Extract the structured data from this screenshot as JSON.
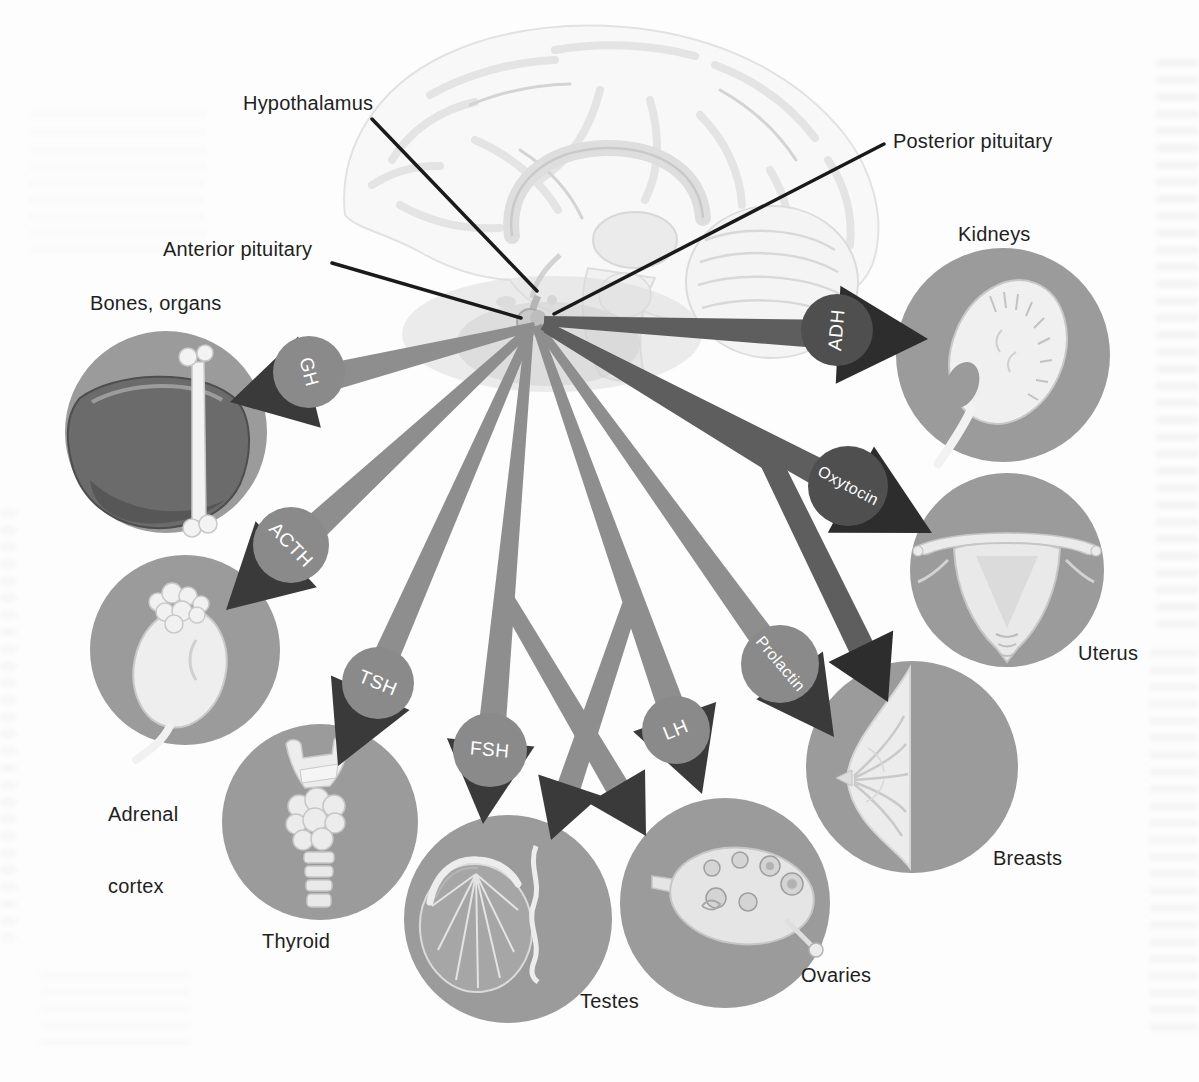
{
  "figure": {
    "brain_labels": {
      "hypothalamus": "Hypothalamus",
      "anterior_pituitary": "Anterior pituitary",
      "posterior_pituitary": "Posterior pituitary"
    },
    "hormones": {
      "gh": "GH",
      "acth": "ACTH",
      "tsh": "TSH",
      "fsh": "FSH",
      "lh": "LH",
      "prolactin": "Prolactin",
      "oxytocin": "Oxytocin",
      "adh": "ADH"
    },
    "targets": {
      "bones_organs": "Bones, organs",
      "adrenal_line1": "Adrenal",
      "adrenal_line2": "cortex",
      "thyroid": "Thyroid",
      "testes": "Testes",
      "ovaries": "Ovaries",
      "breasts": "Breasts",
      "uterus": "Uterus",
      "kidneys": "Kidneys"
    },
    "connections": [
      {
        "hormone": "GH",
        "source": "Anterior pituitary",
        "target": "Bones, organs"
      },
      {
        "hormone": "ACTH",
        "source": "Anterior pituitary",
        "target": "Adrenal cortex"
      },
      {
        "hormone": "TSH",
        "source": "Anterior pituitary",
        "target": "Thyroid"
      },
      {
        "hormone": "FSH",
        "source": "Anterior pituitary",
        "target": "Testes"
      },
      {
        "hormone": "FSH",
        "source": "Anterior pituitary",
        "target": "Ovaries"
      },
      {
        "hormone": "LH",
        "source": "Anterior pituitary",
        "target": "Ovaries"
      },
      {
        "hormone": "LH",
        "source": "Anterior pituitary",
        "target": "Testes"
      },
      {
        "hormone": "Prolactin",
        "source": "Anterior pituitary",
        "target": "Breasts"
      },
      {
        "hormone": "Oxytocin",
        "source": "Posterior pituitary",
        "target": "Uterus"
      },
      {
        "hormone": "Oxytocin",
        "source": "Posterior pituitary",
        "target": "Breasts"
      },
      {
        "hormone": "ADH",
        "source": "Posterior pituitary",
        "target": "Kidneys"
      }
    ],
    "colors": {
      "background": "#fdfdfd",
      "anterior_arrow_shaft": "#8e8e8e",
      "anterior_arrow_head": "#3a3a3a",
      "anterior_label_circle": "#8a8a8a",
      "posterior_arrow_shaft": "#5e5e5e",
      "posterior_arrow_head": "#2d2d2d",
      "posterior_label_circle": "#4f4f4f",
      "organ_circle": "#9b9b9b",
      "hormone_text": "#ffffff",
      "label_text": "#1f1f1f",
      "leader_line": "#1a1a1a"
    }
  }
}
